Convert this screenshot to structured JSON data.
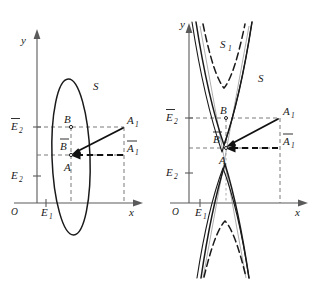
{
  "figure": {
    "kind": "geometry-diagram-pair",
    "background_color": "#ffffff",
    "ink_color": "#1a1a1a",
    "faint_ink_color": "#8a8a8a",
    "width": 316,
    "height": 282
  },
  "left_panel": {
    "name": "ellipse-diagram",
    "curve_type": "ellipse",
    "axes": {
      "y_label": "y",
      "x_label": "x",
      "origin_label": "O"
    },
    "y_ticks": [
      {
        "id": "E2bar",
        "label": "E",
        "sub": "2",
        "overline": true
      },
      {
        "id": "E2",
        "label": "E",
        "sub": "2",
        "overline": false
      }
    ],
    "x_ticks": [
      {
        "id": "E1",
        "label": "E",
        "sub": "1",
        "overline": false
      }
    ],
    "curve_label": {
      "text": "S",
      "sub": ""
    },
    "points": [
      {
        "id": "B",
        "label": "B",
        "sub": "",
        "overline": false
      },
      {
        "id": "Bbar",
        "label": "B",
        "sub": "",
        "overline": true
      },
      {
        "id": "A",
        "label": "A",
        "sub": "",
        "overline": false
      },
      {
        "id": "A1",
        "label": "A",
        "sub": "1",
        "overline": false
      },
      {
        "id": "A1bar",
        "label": "A",
        "sub": "1",
        "overline": true
      }
    ],
    "vectors": [
      {
        "id": "solid-vector",
        "from": "A1",
        "to": "A",
        "style": "solid"
      },
      {
        "id": "dashed-vector",
        "from": "A1bar",
        "to": "A",
        "style": "dashed"
      }
    ]
  },
  "right_panel": {
    "name": "hyperbola-diagram",
    "curve_type": "hyperbola",
    "axes": {
      "y_label": "y",
      "x_label": "x",
      "origin_label": "O"
    },
    "y_ticks": [
      {
        "id": "E2bar",
        "label": "E",
        "sub": "2",
        "overline": true
      },
      {
        "id": "E2",
        "label": "E",
        "sub": "2",
        "overline": false
      }
    ],
    "x_ticks": [
      {
        "id": "E1",
        "label": "E",
        "sub": "1",
        "overline": false
      }
    ],
    "curve_labels": [
      {
        "id": "S1",
        "label": "S",
        "sub": "1",
        "style": "dashed"
      },
      {
        "id": "S",
        "label": "S",
        "sub": "",
        "style": "solid"
      }
    ],
    "points": [
      {
        "id": "B",
        "label": "B",
        "sub": "",
        "overline": false
      },
      {
        "id": "Bbar",
        "label": "B",
        "sub": "",
        "overline": true
      },
      {
        "id": "A",
        "label": "A",
        "sub": "",
        "overline": false
      },
      {
        "id": "A1",
        "label": "A",
        "sub": "1",
        "overline": false
      },
      {
        "id": "A1bar",
        "label": "A",
        "sub": "1",
        "overline": true
      }
    ],
    "vectors": [
      {
        "id": "solid-vector",
        "from": "A1",
        "to": "A",
        "style": "solid"
      },
      {
        "id": "dashed-vector",
        "from": "A1bar",
        "to": "A",
        "style": "dashed"
      }
    ]
  }
}
